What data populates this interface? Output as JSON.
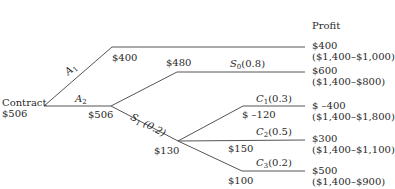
{
  "diagram": {
    "type": "decision-tree",
    "header": {
      "profit_label": "Profit"
    },
    "root": {
      "label": "Contract",
      "value": "$506"
    },
    "decisions": [
      {
        "id": "A1",
        "name": "A",
        "sub": "1",
        "node_value": "$400",
        "outcome": {
          "profit": "$400",
          "calc": "($1,400–$1,000)"
        }
      },
      {
        "id": "A2",
        "name": "A",
        "sub": "2",
        "node_value": "$506"
      }
    ],
    "states": [
      {
        "id": "S0",
        "name": "S",
        "sub": "0",
        "prob": "(0.8)",
        "node_value": "$480",
        "outcome": {
          "profit": "$600",
          "calc": "($1,400–$800)"
        }
      },
      {
        "id": "S1",
        "name": "S",
        "sub": "1",
        "prob": "(0.2)",
        "node_value": "$130"
      }
    ],
    "costs": [
      {
        "id": "C1",
        "name": "C",
        "sub": "1",
        "prob": "(0.3)",
        "node_value": "$ –120",
        "outcome": {
          "profit": "$ –400",
          "calc": "($1,400–$1,800)"
        }
      },
      {
        "id": "C2",
        "name": "C",
        "sub": "2",
        "prob": "(0.5)",
        "node_value": "$150",
        "outcome": {
          "profit": "$300",
          "calc": "($1,400–$1,100)"
        }
      },
      {
        "id": "C3",
        "name": "C",
        "sub": "3",
        "prob": "(0.2)",
        "node_value": "$100",
        "outcome": {
          "profit": "$500",
          "calc": "($1,400–$900)"
        }
      }
    ],
    "line_color": "#555555"
  }
}
